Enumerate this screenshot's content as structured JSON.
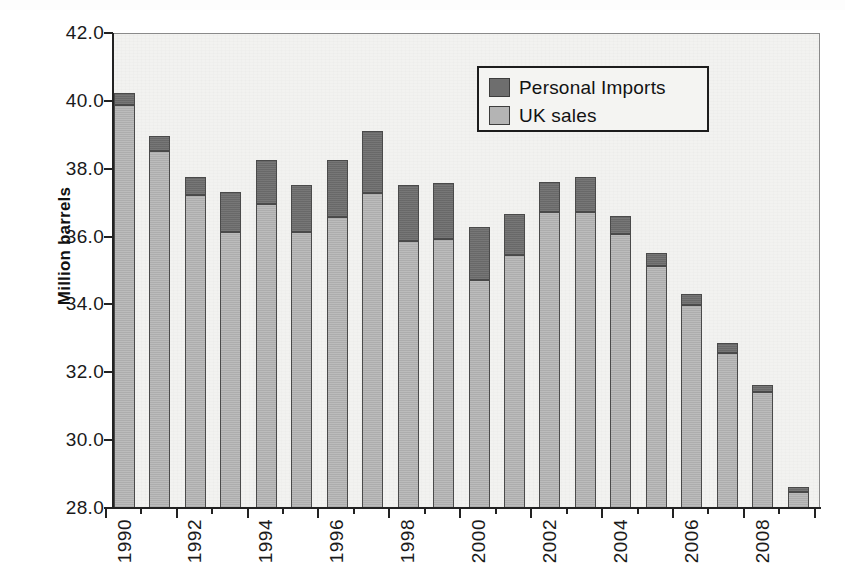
{
  "chart_data": {
    "type": "bar",
    "stacked": true,
    "title": "",
    "xlabel": "",
    "ylabel": "Million barrels",
    "ylim": [
      28.0,
      42.0
    ],
    "ytick_step": 2.0,
    "ytick_labels": [
      "42.0",
      "40.0",
      "38.0",
      "36.0",
      "34.0",
      "32.0",
      "30.0",
      "28.0"
    ],
    "ytick_values": [
      42.0,
      40.0,
      38.0,
      36.0,
      34.0,
      32.0,
      30.0,
      28.0
    ],
    "grid": false,
    "legend_position": "upper-right-inside",
    "categories": [
      "1990",
      "1991",
      "1992",
      "1993",
      "1994",
      "1995",
      "1996",
      "1997",
      "1998",
      "1999",
      "2000",
      "2001",
      "2002",
      "2003",
      "2004",
      "2005",
      "2006",
      "2007",
      "2008",
      "2009"
    ],
    "xtick_labels_shown": [
      "1990",
      "1992",
      "1994",
      "1996",
      "1998",
      "2000",
      "2002",
      "2004",
      "2006",
      "2008"
    ],
    "series": [
      {
        "name": "UK sales",
        "color": "#b4b4b4",
        "values": [
          39.9,
          38.55,
          37.25,
          36.15,
          37.0,
          36.15,
          36.6,
          37.3,
          35.9,
          35.95,
          34.75,
          35.5,
          36.75,
          36.75,
          36.1,
          35.15,
          34.0,
          32.6,
          31.45,
          28.5
        ]
      },
      {
        "name": "Personal Imports",
        "color": "#6e6e6e",
        "values": [
          0.35,
          0.45,
          0.55,
          1.2,
          1.3,
          1.4,
          1.7,
          1.85,
          1.65,
          1.65,
          1.55,
          1.2,
          0.9,
          1.05,
          0.55,
          0.4,
          0.35,
          0.3,
          0.2,
          0.15
        ]
      }
    ],
    "totals": [
      40.25,
      39.0,
      37.8,
      37.35,
      38.3,
      37.55,
      38.3,
      39.15,
      37.55,
      37.6,
      36.3,
      36.7,
      37.65,
      37.8,
      36.65,
      35.55,
      34.35,
      32.9,
      31.65,
      28.65
    ]
  },
  "legend": {
    "items": [
      {
        "label": "Personal Imports",
        "swatch": "dark"
      },
      {
        "label": "UK sales",
        "swatch": "light"
      }
    ]
  },
  "axis": {
    "y_title": "Million barrels"
  },
  "colors": {
    "personal_imports": "#6e6e6e",
    "uk_sales": "#b4b4b4",
    "plot_background": "#f2f2f0",
    "axis": "#222222",
    "legend_border": "#1d1d1d"
  }
}
